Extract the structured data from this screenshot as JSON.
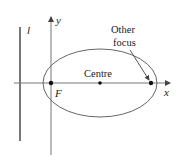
{
  "diagram": {
    "colors": {
      "stroke": "#555555",
      "axis": "#777777",
      "text": "#222222",
      "point": "#111111"
    },
    "labels": {
      "directrix": "l",
      "y_axis": "y",
      "x_axis": "x",
      "focus": "F",
      "centre": "Centre",
      "other_focus_line1": "Other",
      "other_focus_line2": "focus"
    },
    "geometry": {
      "ellipse": {
        "cx": 100,
        "cy": 83,
        "rx": 57,
        "ry": 34
      },
      "focus": {
        "x": 51,
        "y": 83
      },
      "centre": {
        "x": 100,
        "y": 83
      },
      "other_focus": {
        "x": 151,
        "y": 83
      },
      "directrix_x": 20
    }
  }
}
